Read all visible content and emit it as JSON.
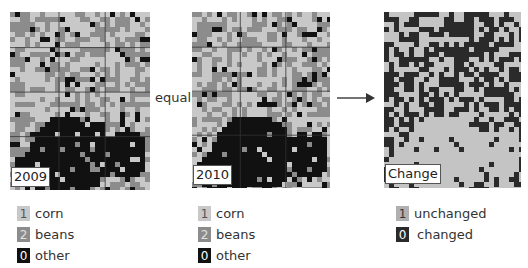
{
  "panels": [
    {
      "id": "2009",
      "label": "2009"
    },
    {
      "id": "2010",
      "label": "2010"
    },
    {
      "id": "change",
      "label": "Change"
    }
  ],
  "operator_label": "equal",
  "arrow": "right-arrow",
  "legends": {
    "left": [
      {
        "value": "1",
        "label": "corn",
        "color": "#c8c8c8",
        "text_color": "#555555"
      },
      {
        "value": "2",
        "label": "beans",
        "color": "#8c8c8c",
        "text_color": "#e0e0e0"
      },
      {
        "value": "0",
        "label": "other",
        "color": "#111111",
        "text_color": "#ffffff"
      }
    ],
    "middle": [
      {
        "value": "1",
        "label": "corn",
        "color": "#c8c8c8",
        "text_color": "#555555"
      },
      {
        "value": "2",
        "label": "beans",
        "color": "#8c8c8c",
        "text_color": "#e0e0e0"
      },
      {
        "value": "0",
        "label": "other",
        "color": "#111111",
        "text_color": "#ffffff"
      }
    ],
    "right": [
      {
        "value": "1",
        "label": "unchanged",
        "color": "#b0b0b0",
        "text_color": "#333333"
      },
      {
        "value": "0",
        "label": "changed",
        "color": "#2a2a2a",
        "text_color": "#ffffff"
      }
    ]
  },
  "colors": {
    "corn": "#c8c8c8",
    "beans": "#8c8c8c",
    "other": "#111111",
    "unchanged": "#c4c4c4",
    "changed": "#2a2a2a"
  }
}
